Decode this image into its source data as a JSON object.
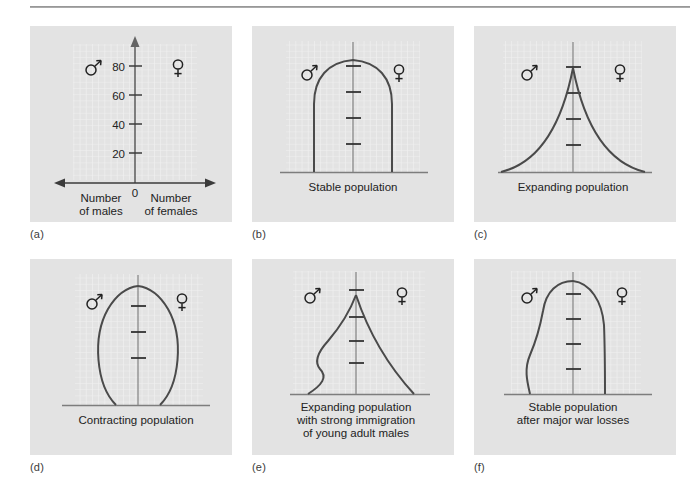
{
  "figure": {
    "type": "diagram-set",
    "background_color": "#ffffff",
    "panel_color": "#e3e3e3",
    "grid_color": "#f4f4f4",
    "curve_color": "#4a4a4a",
    "text_color": "#221f1f"
  },
  "symbols": {
    "male": "male-symbol",
    "female": "female-symbol"
  },
  "panels": [
    {
      "key": "a",
      "label": "(a)",
      "caption": "",
      "axis": {
        "y_ticks": [
          "20",
          "40",
          "60",
          "80"
        ],
        "origin_label": "0",
        "left_axis_label_line1": "Number",
        "left_axis_label_line2": "of males",
        "right_axis_label_line1": "Number",
        "right_axis_label_line2": "of females"
      }
    },
    {
      "key": "b",
      "label": "(b)",
      "caption_lines": [
        "Stable population"
      ]
    },
    {
      "key": "c",
      "label": "(c)",
      "caption_lines": [
        "Expanding population"
      ]
    },
    {
      "key": "d",
      "label": "(d)",
      "caption_lines": [
        "Contracting population"
      ]
    },
    {
      "key": "e",
      "label": "(e)",
      "caption_lines": [
        "Expanding population",
        "with strong immigration",
        "of young adult males"
      ]
    },
    {
      "key": "f",
      "label": "(f)",
      "caption_lines": [
        "Stable population",
        "after major war losses"
      ]
    }
  ]
}
